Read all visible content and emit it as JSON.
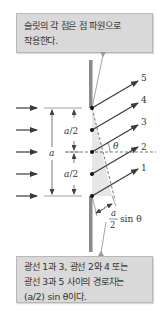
{
  "callouts": {
    "top": {
      "line1": "슬릿의 각 점은 점 파원으로",
      "line2": "작용한다."
    },
    "bottom": {
      "line1": "광선 1과 3, 광선 2와 4 또는",
      "line2": "광선 3과 5 사이의 경로차는",
      "line3": "(a/2) sin θ이다."
    }
  },
  "diagram": {
    "ray_labels": [
      "5",
      "4",
      "3",
      "2",
      "1"
    ],
    "angle_label": "θ",
    "slit_width_label": "a",
    "half_width_label_upper": "a/2",
    "half_width_label_lower": "a/2",
    "path_difference_label": {
      "numerator": "a",
      "denominator": "2",
      "suffix": "sin θ"
    }
  },
  "colors": {
    "callout_fill": "#d9d9d9",
    "wall": "#8a8a8a",
    "rays": "#3a3a3a",
    "shaded_region": "#e6e6e6"
  }
}
